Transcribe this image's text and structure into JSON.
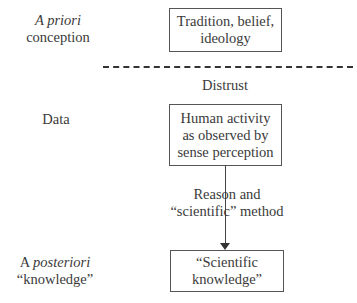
{
  "left_labels": {
    "a_priori": {
      "italic": "A priori",
      "line2": "conception",
      "prefix": ""
    },
    "data": "Data",
    "a_posteriori": {
      "prefix": "A ",
      "italic": "posteriori",
      "line2": "“knowledge”"
    }
  },
  "boxes": {
    "tradition": {
      "line1": "Tradition, belief,",
      "line2": "ideology"
    },
    "human_activity": {
      "line1": "Human activity",
      "line2": "as observed by",
      "line3": "sense perception"
    },
    "scientific_knowledge": {
      "line1": "“Scientific",
      "line2": "knowledge”"
    }
  },
  "separator_label": "Distrust",
  "arrow_label": {
    "line1": "Reason and",
    "line2": "“scientific” method"
  },
  "colors": {
    "border": "#555555",
    "text": "#3a3a3a",
    "background": "#ffffff"
  }
}
